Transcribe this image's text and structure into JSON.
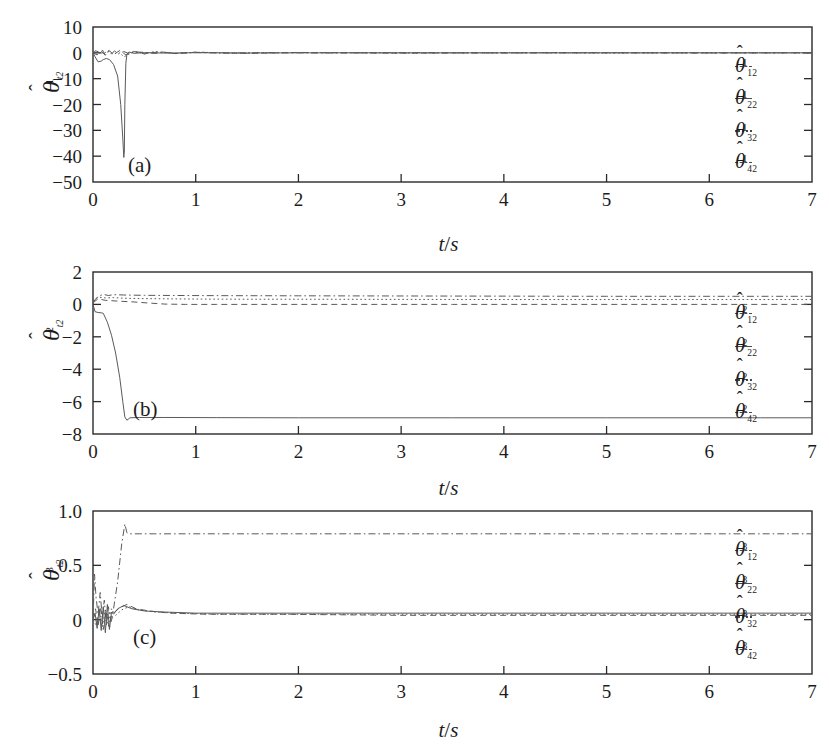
{
  "figure": {
    "background": "#ffffff",
    "line_color": "#5a5a5a",
    "axis_color": "#2a2a2a"
  },
  "chart_data": [
    {
      "type": "line",
      "panel": "(a)",
      "title": "",
      "xlabel": "t/s",
      "ylabel": "theta-hat^1_t2",
      "ylabel_parts": {
        "base": "θ",
        "hat": "^",
        "sub": "t2",
        "sup": "1"
      },
      "xlim": [
        0,
        7
      ],
      "ylim": [
        -50,
        10
      ],
      "xticks": [
        0,
        1,
        2,
        3,
        4,
        5,
        6,
        7
      ],
      "xticklabels": [
        "0",
        "1",
        "2",
        "3",
        "4",
        "5",
        "6",
        "7"
      ],
      "yticks": [
        10,
        0,
        -10,
        -20,
        -30,
        -40,
        -50
      ],
      "yticklabels": [
        "10",
        "0",
        "−10",
        "−20",
        "−30",
        "−40",
        "−50"
      ],
      "grid": false,
      "legend_position": "right-inside",
      "series": [
        {
          "name": "theta-hat^1_12",
          "label_parts": {
            "base": "θ",
            "sub": "12",
            "sup": "1"
          },
          "style": "dashdot",
          "x": [
            0,
            0.03,
            0.06,
            0.09,
            0.12,
            0.15,
            0.18,
            0.21,
            0.25,
            0.3,
            0.35,
            0.4,
            0.5,
            0.6,
            0.7,
            0.8,
            1.0,
            1.3,
            1.7,
            2.2,
            3.0,
            4.0,
            5.0,
            6.0,
            7.0
          ],
          "y": [
            0,
            0.9,
            -0.6,
            1.2,
            -0.9,
            0.7,
            -0.5,
            0.8,
            -0.4,
            0.5,
            -0.3,
            0.35,
            0.2,
            -0.25,
            0.2,
            -0.15,
            0.1,
            -0.1,
            0.08,
            -0.06,
            0.05,
            -0.04,
            0.03,
            -0.03,
            0.02
          ]
        },
        {
          "name": "theta-hat^1_22",
          "label_parts": {
            "base": "θ",
            "sub": "22",
            "sup": "1"
          },
          "style": "solid",
          "x": [
            0,
            0.02,
            0.05,
            0.08,
            0.1,
            0.13,
            0.16,
            0.2,
            0.24,
            0.27,
            0.29,
            0.3,
            0.305,
            0.31,
            0.32,
            0.33,
            0.35,
            0.4,
            0.5,
            0.7,
            1.0,
            1.5,
            2.5,
            4.0,
            5.5,
            7.0
          ],
          "y": [
            0,
            -1.5,
            -3.5,
            -3.2,
            -2.6,
            -2.2,
            -2.6,
            -4.5,
            -9.0,
            -20.0,
            -33.0,
            -40.5,
            -38.0,
            -20.0,
            -4.0,
            -0.5,
            0.3,
            -0.2,
            0.1,
            -0.1,
            0.05,
            -0.05,
            0.02,
            -0.02,
            0.01,
            0.0
          ]
        },
        {
          "name": "theta-hat^1_32",
          "label_parts": {
            "base": "θ",
            "sub": "32",
            "sup": "1"
          },
          "style": "dotted",
          "x": [
            0,
            0.05,
            0.1,
            0.15,
            0.2,
            0.25,
            0.3,
            0.4,
            0.5,
            0.6,
            0.8,
            1.0,
            1.4,
            2.0,
            3.0,
            4.0,
            5.0,
            6.0,
            7.0
          ],
          "y": [
            0,
            0.6,
            -0.4,
            0.9,
            -0.6,
            0.5,
            -1.6,
            0.6,
            -0.4,
            0.5,
            -0.3,
            0.25,
            -0.2,
            0.15,
            -0.1,
            0.1,
            -0.08,
            0.06,
            -0.05
          ]
        },
        {
          "name": "theta-hat^1_42",
          "label_parts": {
            "base": "θ",
            "sub": "42",
            "sup": "1"
          },
          "style": "dashed",
          "x": [
            0,
            0.04,
            0.08,
            0.12,
            0.16,
            0.2,
            0.26,
            0.32,
            0.4,
            0.5,
            0.65,
            0.8,
            1.0,
            1.5,
            2.0,
            3.0,
            4.5,
            6.0,
            7.0
          ],
          "y": [
            0,
            -0.8,
            0.7,
            -1.0,
            0.8,
            -0.7,
            0.9,
            -0.8,
            0.5,
            -0.4,
            0.45,
            -0.3,
            0.25,
            -0.2,
            0.15,
            -0.12,
            0.08,
            -0.06,
            0.04
          ]
        }
      ]
    },
    {
      "type": "line",
      "panel": "(b)",
      "title": "",
      "xlabel": "t/s",
      "ylabel": "theta-hat^2_t2",
      "ylabel_parts": {
        "base": "θ",
        "hat": "^",
        "sub": "t2",
        "sup": "2"
      },
      "xlim": [
        0,
        7
      ],
      "ylim": [
        -8,
        2
      ],
      "xticks": [
        0,
        1,
        2,
        3,
        4,
        5,
        6,
        7
      ],
      "xticklabels": [
        "0",
        "1",
        "2",
        "3",
        "4",
        "5",
        "6",
        "7"
      ],
      "yticks": [
        2,
        0,
        -2,
        -4,
        -6,
        -8
      ],
      "yticklabels": [
        "2",
        "0",
        "−2",
        "−4",
        "−6",
        "−8"
      ],
      "grid": false,
      "legend_position": "right-inside",
      "series": [
        {
          "name": "theta-hat^2_12",
          "label_parts": {
            "base": "θ",
            "sub": "12",
            "sup": "2"
          },
          "style": "dashdot",
          "x": [
            0,
            0.05,
            0.1,
            0.15,
            0.2,
            0.3,
            0.5,
            0.8,
            1.2,
            2.0,
            3.0,
            4.0,
            5.0,
            6.0,
            7.0
          ],
          "y": [
            0.15,
            0.5,
            0.62,
            0.55,
            0.6,
            0.58,
            0.56,
            0.55,
            0.54,
            0.53,
            0.52,
            0.51,
            0.5,
            0.5,
            0.5
          ]
        },
        {
          "name": "theta-hat^2_22",
          "label_parts": {
            "base": "θ",
            "sub": "22",
            "sup": "2"
          },
          "style": "solid",
          "x": [
            0,
            0.02,
            0.05,
            0.08,
            0.1,
            0.14,
            0.18,
            0.22,
            0.26,
            0.29,
            0.31,
            0.33,
            0.36,
            0.45,
            0.7,
            1.2,
            2.0,
            3.5,
            5.0,
            6.5,
            7.0
          ],
          "y": [
            0,
            -0.45,
            -0.5,
            -0.52,
            -0.55,
            -1.1,
            -1.9,
            -3.0,
            -4.5,
            -6.0,
            -6.95,
            -7.15,
            -7.0,
            -6.98,
            -6.98,
            -6.99,
            -7.0,
            -7.0,
            -7.0,
            -7.0,
            -7.0
          ]
        },
        {
          "name": "theta-hat^2_32",
          "label_parts": {
            "base": "θ",
            "sub": "32",
            "sup": "2"
          },
          "style": "dotted",
          "x": [
            0,
            0.05,
            0.12,
            0.2,
            0.3,
            0.45,
            0.6,
            0.8,
            1.0,
            1.5,
            2.0,
            3.0,
            4.0,
            5.0,
            6.0,
            7.0
          ],
          "y": [
            0.2,
            0.45,
            0.4,
            0.42,
            0.38,
            0.36,
            0.35,
            0.34,
            0.33,
            0.32,
            0.32,
            0.31,
            0.3,
            0.3,
            0.3,
            0.3
          ]
        },
        {
          "name": "theta-hat^2_42",
          "label_parts": {
            "base": "θ",
            "sub": "42",
            "sup": "2"
          },
          "style": "dashed",
          "x": [
            0,
            0.05,
            0.12,
            0.25,
            0.4,
            0.55,
            0.7,
            0.9,
            1.2,
            1.8,
            2.5,
            3.5,
            4.5,
            5.5,
            6.5,
            7.0
          ],
          "y": [
            0.1,
            0.35,
            0.25,
            0.2,
            0.15,
            0.08,
            0.02,
            0.0,
            0.0,
            0.0,
            0.0,
            0.0,
            0.0,
            0.0,
            0.0,
            0.0
          ]
        }
      ]
    },
    {
      "type": "line",
      "panel": "(c)",
      "title": "",
      "xlabel": "t/s",
      "ylabel": "theta-hat^3_t2",
      "ylabel_parts": {
        "base": "θ",
        "hat": "^",
        "sub": "t2",
        "sup": "3"
      },
      "xlim": [
        0,
        7
      ],
      "ylim": [
        -0.5,
        1.0
      ],
      "xticks": [
        0,
        1,
        2,
        3,
        4,
        5,
        6,
        7
      ],
      "xticklabels": [
        "0",
        "1",
        "2",
        "3",
        "4",
        "5",
        "6",
        "7"
      ],
      "yticks": [
        1.0,
        0.5,
        0,
        -0.5
      ],
      "yticklabels": [
        "1.0",
        "0.5",
        "0",
        "−0.5"
      ],
      "grid": false,
      "legend_position": "right-inside",
      "series": [
        {
          "name": "theta-hat^3_12",
          "label_parts": {
            "base": "θ",
            "sub": "12",
            "sup": "3"
          },
          "style": "dashdot",
          "x": [
            0,
            0.015,
            0.03,
            0.05,
            0.07,
            0.09,
            0.11,
            0.13,
            0.15,
            0.17,
            0.2,
            0.24,
            0.28,
            0.31,
            0.33,
            0.36,
            0.45,
            0.6,
            0.9,
            1.5,
            2.5,
            4.0,
            5.5,
            7.0
          ],
          "y": [
            0.0,
            0.42,
            0.2,
            0.05,
            0.25,
            0.02,
            0.18,
            -0.05,
            0.12,
            0.0,
            0.1,
            0.35,
            0.7,
            0.88,
            0.8,
            0.79,
            0.79,
            0.79,
            0.79,
            0.79,
            0.79,
            0.79,
            0.79,
            0.79
          ]
        },
        {
          "name": "theta-hat^3_22",
          "label_parts": {
            "base": "θ",
            "sub": "22",
            "sup": "3"
          },
          "style": "solid",
          "x": [
            0,
            0.02,
            0.04,
            0.06,
            0.08,
            0.1,
            0.12,
            0.14,
            0.16,
            0.18,
            0.2,
            0.24,
            0.3,
            0.38,
            0.5,
            0.7,
            1.0,
            1.5,
            2.5,
            4.0,
            5.5,
            7.0
          ],
          "y": [
            0.0,
            0.06,
            -0.08,
            0.1,
            -0.1,
            0.12,
            -0.12,
            0.14,
            -0.09,
            0.07,
            0.05,
            0.1,
            0.13,
            0.1,
            0.08,
            0.07,
            0.06,
            0.06,
            0.06,
            0.06,
            0.06,
            0.06
          ]
        },
        {
          "name": "theta-hat^3_32",
          "label_parts": {
            "base": "θ",
            "sub": "32",
            "sup": "3"
          },
          "style": "dotted",
          "x": [
            0,
            0.03,
            0.06,
            0.09,
            0.12,
            0.15,
            0.18,
            0.22,
            0.28,
            0.35,
            0.45,
            0.6,
            0.85,
            1.2,
            2.0,
            3.0,
            4.5,
            6.0,
            7.0
          ],
          "y": [
            0.0,
            -0.05,
            0.08,
            -0.07,
            0.09,
            -0.06,
            0.1,
            0.04,
            0.09,
            0.12,
            0.09,
            0.07,
            0.06,
            0.05,
            0.05,
            0.05,
            0.05,
            0.05,
            0.05
          ]
        },
        {
          "name": "theta-hat^3_42",
          "label_parts": {
            "base": "θ",
            "sub": "42",
            "sup": "3"
          },
          "style": "dashed",
          "x": [
            0,
            0.025,
            0.05,
            0.075,
            0.1,
            0.13,
            0.16,
            0.2,
            0.26,
            0.33,
            0.42,
            0.55,
            0.75,
            1.1,
            1.8,
            3.0,
            4.5,
            6.0,
            7.0
          ],
          "y": [
            0.0,
            0.1,
            -0.06,
            0.12,
            -0.09,
            0.07,
            -0.07,
            0.06,
            0.11,
            0.14,
            0.1,
            0.08,
            0.06,
            0.05,
            0.05,
            0.04,
            0.04,
            0.04,
            0.04
          ]
        }
      ]
    }
  ]
}
